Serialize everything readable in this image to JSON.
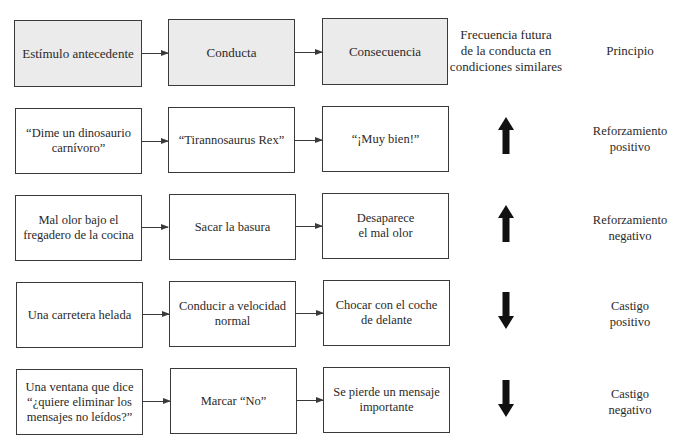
{
  "header": {
    "antecedent": "Estímulo antecedente",
    "behavior": "Conducta",
    "consequence": "Consecuencia",
    "frequency": "Frecuencia futura\nde la conducta en\ncondiciones similares",
    "principle": "Principio"
  },
  "rows": [
    {
      "antecedent": "“Dime un dinosaurio\ncarnívoro”",
      "behavior": "“Tirannosaurus Rex”",
      "consequence": "“¡Muy bien!”",
      "frequency_direction": "up",
      "frequency_icon": "arrow-up-icon",
      "principle": "Reforzamiento\npositivo"
    },
    {
      "antecedent": "Mal olor bajo el\nfregadero de la cocina",
      "behavior": "Sacar la basura",
      "consequence": "Desaparece\nel mal olor",
      "frequency_direction": "up",
      "frequency_icon": "arrow-up-icon",
      "principle": "Reforzamiento\nnegativo"
    },
    {
      "antecedent": "Una carretera helada",
      "behavior": "Conducir a velocidad\nnormal",
      "consequence": "Chocar con el coche\nde delante",
      "frequency_direction": "down",
      "frequency_icon": "arrow-down-icon",
      "principle": "Castigo\npositivo"
    },
    {
      "antecedent": "Una ventana que dice\n“¿quiere eliminar los\nmensajes no leídos?”",
      "behavior": "Marcar “No”",
      "consequence": "Se pierde un mensaje\nimportante",
      "frequency_direction": "down",
      "frequency_icon": "arrow-down-icon",
      "principle": "Castigo\nnegativo"
    }
  ],
  "colors": {
    "header_fill": "#ebebeb",
    "border": "#3a3a3a",
    "arrow": "#111111"
  }
}
